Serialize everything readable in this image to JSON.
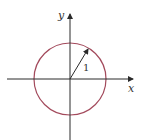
{
  "diagram": {
    "labels": {
      "x_axis": "x",
      "y_axis": "y",
      "radius": "1"
    },
    "colors": {
      "axis": "#2a2a2a",
      "circle": "#a34a5c",
      "radius_arrow": "#2a2a2a"
    },
    "circle": {
      "center": [
        0,
        0
      ],
      "radius": 1
    },
    "radius_angle_deg": 60
  }
}
